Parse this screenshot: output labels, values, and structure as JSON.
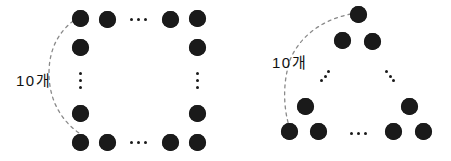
{
  "figure": {
    "background_color": "#ffffff",
    "dot_color": "#1a1a1a",
    "arc_color": "#8a8a8a",
    "panels": [
      {
        "id": "left-panel",
        "name": "square-ring-arrangement",
        "label": {
          "text": "10개",
          "x": 16,
          "y": 73
        },
        "arc": {
          "name": "brace-arc-left",
          "path": "M 79 17 C 58 30 49 50 49 73 C 49 96 58 118 79 133",
          "dash": "3,4"
        },
        "dot_radius": 8.5,
        "dots": [
          {
            "x": 80,
            "y": 18
          },
          {
            "x": 107,
            "y": 19
          },
          {
            "x": 170,
            "y": 19
          },
          {
            "x": 197,
            "y": 18
          },
          {
            "x": 80,
            "y": 47
          },
          {
            "x": 197,
            "y": 47
          },
          {
            "x": 80,
            "y": 113
          },
          {
            "x": 197,
            "y": 113
          },
          {
            "x": 80,
            "y": 142
          },
          {
            "x": 107,
            "y": 142
          },
          {
            "x": 170,
            "y": 142
          },
          {
            "x": 197,
            "y": 142
          }
        ],
        "ellipses": [
          {
            "name": "horizontal-ellipsis-top",
            "orientation": "horizontal",
            "cx": 138,
            "cy": 19,
            "spacing": 7
          },
          {
            "name": "horizontal-ellipsis-bottom",
            "orientation": "horizontal",
            "cx": 138,
            "cy": 142,
            "spacing": 7
          },
          {
            "name": "vertical-ellipsis-left",
            "orientation": "vertical",
            "cx": 80,
            "cy": 80,
            "spacing": 7
          },
          {
            "name": "vertical-ellipsis-right",
            "orientation": "vertical",
            "cx": 197,
            "cy": 80,
            "spacing": 7
          }
        ]
      },
      {
        "id": "right-panel",
        "name": "triangle-arrangement",
        "label": {
          "text": "10개",
          "x": 272,
          "y": 55
        },
        "arc": {
          "name": "brace-arc-right",
          "path": "M 351 14 C 320 20 299 38 290 60 C 283 82 283 105 289 126",
          "dash": "3,4"
        },
        "dot_radius": 8.5,
        "dots": [
          {
            "x": 358,
            "y": 14
          },
          {
            "x": 342,
            "y": 40
          },
          {
            "x": 372,
            "y": 41
          },
          {
            "x": 305,
            "y": 106
          },
          {
            "x": 289,
            "y": 131
          },
          {
            "x": 318,
            "y": 131
          },
          {
            "x": 409,
            "y": 106
          },
          {
            "x": 393,
            "y": 131
          },
          {
            "x": 423,
            "y": 131
          }
        ],
        "ellipses": [
          {
            "name": "diagonal-ellipsis-left",
            "orientation": "diag-up",
            "cx": 325,
            "cy": 76,
            "spacing": 6
          },
          {
            "name": "diagonal-ellipsis-right",
            "orientation": "diag-down",
            "cx": 390,
            "cy": 76,
            "spacing": 6
          },
          {
            "name": "horizontal-ellipsis-bottom",
            "orientation": "horizontal",
            "cx": 358,
            "cy": 133,
            "spacing": 7
          }
        ]
      }
    ]
  }
}
